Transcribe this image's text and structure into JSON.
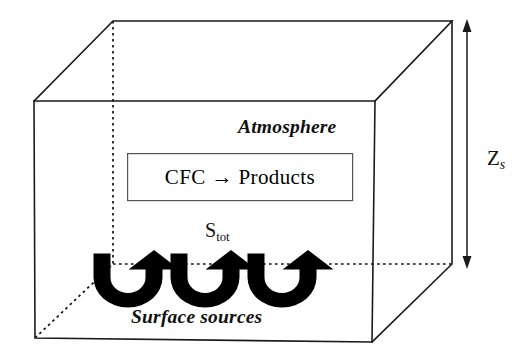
{
  "diagram": {
    "labels": {
      "atmosphere": "Atmosphere",
      "surface_sources": "Surface sources",
      "reaction_box": "CFC → Products",
      "total_source_symbol": "S",
      "total_source_subscript": "tot",
      "height_symbol": "Z",
      "height_subscript": "s"
    },
    "colors": {
      "edge": "#1a1a1a",
      "hidden_edge": "#111111",
      "arrow_fill": "#000000",
      "reaction_box_border": "#555555",
      "background": "#ffffff",
      "text": "#111111"
    },
    "geometry": {
      "front_face": {
        "top_left": [
          34,
          101
        ],
        "top_right": [
          375,
          101
        ],
        "bottom_right": [
          372,
          342
        ],
        "bottom_left": [
          35,
          338
        ]
      },
      "back_face": {
        "top_left": [
          113,
          21
        ],
        "top_right": [
          452,
          21
        ],
        "bottom_right": [
          452,
          264
        ],
        "bottom_left": [
          113,
          264
        ]
      },
      "reaction_box": {
        "x": 127,
        "y": 153,
        "width": 226,
        "height": 48
      },
      "dimension_arrow": {
        "x": 467,
        "y_top": 24,
        "y_bottom": 264
      },
      "flux_arrows": [
        {
          "cx": 128,
          "cy": 278
        },
        {
          "cx": 206,
          "cy": 278
        },
        {
          "cx": 283,
          "cy": 278
        }
      ]
    },
    "flux_arrow_count": 3,
    "meaning": {
      "arrow_direction": "upward emission from surface into atmosphere",
      "dimension": "Z_s denotes the height of the well-mixed atmospheric box"
    }
  }
}
